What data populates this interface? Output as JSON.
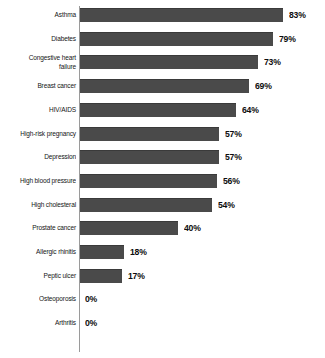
{
  "chart_data": {
    "type": "bar",
    "orientation": "horizontal",
    "title": "",
    "subtitle": "",
    "xlabel": "",
    "ylabel": "",
    "xlim": [
      0,
      100
    ],
    "grid": false,
    "legend": false,
    "value_suffix": "%",
    "bar_color": "#4a4a4a",
    "axis_color": "#9a9a9a",
    "background_color": "#ffffff",
    "categories": [
      "Asthma",
      "Diabetes",
      "Congestive heart\nfailure",
      "Breast cancer",
      "HIV/AIDS",
      "High-risk pregnancy",
      "Depression",
      "High blood pressure",
      "High cholesteral",
      "Prostate cancer",
      "Allergic rhinitis",
      "Peptic ulcer",
      "Osteoporosis",
      "Arthritis"
    ],
    "values": [
      83,
      79,
      73,
      69,
      64,
      57,
      57,
      56,
      54,
      40,
      18,
      17,
      0,
      0
    ],
    "value_labels": [
      "83%",
      "79%",
      "73%",
      "69%",
      "64%",
      "57%",
      "57%",
      "56%",
      "54%",
      "40%",
      "18%",
      "17%",
      "0%",
      "0%"
    ]
  }
}
